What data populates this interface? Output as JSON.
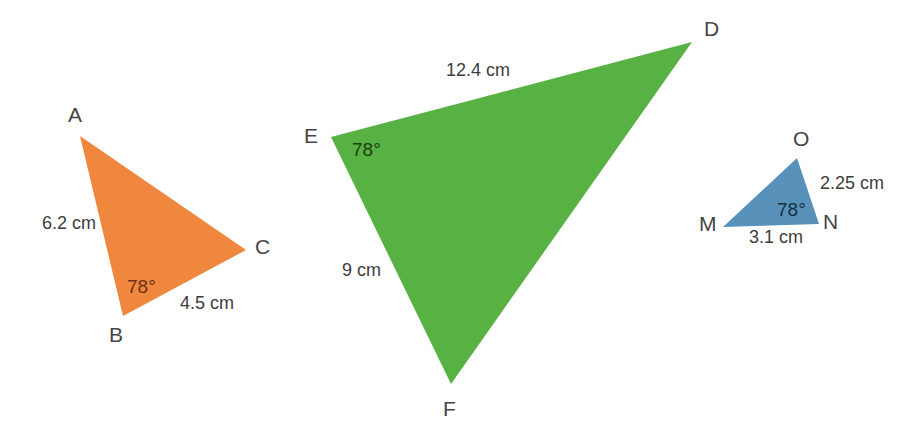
{
  "figure": {
    "background_color": "#ffffff",
    "width": 923,
    "height": 445
  },
  "triangles": [
    {
      "id": "triangle-abc",
      "name": "orange-triangle",
      "fill_color": "#F0873F",
      "vertices": [
        {
          "label": "A",
          "x": 80,
          "y": 136
        },
        {
          "label": "B",
          "x": 123,
          "y": 316
        },
        {
          "label": "C",
          "x": 246,
          "y": 250
        }
      ],
      "vertex_labels": [
        {
          "text": "A",
          "x": 68,
          "y": 104
        },
        {
          "text": "B",
          "x": 109,
          "y": 324
        },
        {
          "text": "C",
          "x": 255,
          "y": 236
        }
      ],
      "side_labels": [
        {
          "text": "6.2 cm",
          "x": 42,
          "y": 214
        },
        {
          "text": "4.5 cm",
          "x": 180,
          "y": 294
        }
      ],
      "angle_labels": [
        {
          "text": "78°",
          "x": 127,
          "y": 277
        }
      ]
    },
    {
      "id": "triangle-def",
      "name": "green-triangle",
      "fill_color": "#57B143",
      "vertices": [
        {
          "label": "D",
          "x": 692,
          "y": 42
        },
        {
          "label": "E",
          "x": 331,
          "y": 137
        },
        {
          "label": "F",
          "x": 451,
          "y": 384
        }
      ],
      "vertex_labels": [
        {
          "text": "D",
          "x": 704,
          "y": 18
        },
        {
          "text": "E",
          "x": 304,
          "y": 125
        },
        {
          "text": "F",
          "x": 443,
          "y": 398
        }
      ],
      "side_labels": [
        {
          "text": "12.4 cm",
          "x": 446,
          "y": 61
        },
        {
          "text": "9 cm",
          "x": 342,
          "y": 261
        }
      ],
      "angle_labels": [
        {
          "text": "78°",
          "x": 352,
          "y": 140
        }
      ]
    },
    {
      "id": "triangle-mno",
      "name": "blue-triangle",
      "fill_color": "#5892BA",
      "vertices": [
        {
          "label": "M",
          "x": 723,
          "y": 227
        },
        {
          "label": "N",
          "x": 819,
          "y": 224
        },
        {
          "label": "O",
          "x": 797,
          "y": 158
        }
      ],
      "vertex_labels": [
        {
          "text": "M",
          "x": 699,
          "y": 213
        },
        {
          "text": "N",
          "x": 823,
          "y": 211
        },
        {
          "text": "O",
          "x": 793,
          "y": 128
        }
      ],
      "side_labels": [
        {
          "text": "2.25 cm",
          "x": 820,
          "y": 174
        },
        {
          "text": "3.1 cm",
          "x": 749,
          "y": 228
        }
      ],
      "angle_labels": [
        {
          "text": "78°",
          "x": 777,
          "y": 200
        }
      ]
    }
  ],
  "labels": {
    "A": "A",
    "B": "B",
    "C": "C",
    "D": "D",
    "E": "E",
    "F": "F",
    "M": "M",
    "N": "N",
    "O": "O",
    "ab_side": "6.2 cm",
    "bc_side": "4.5 cm",
    "abc_angle": "78°",
    "ed_side": "12.4 cm",
    "ef_side": "9 cm",
    "def_angle": "78°",
    "on_side": "2.25 cm",
    "mn_side": "3.1 cm",
    "mno_angle": "78°"
  }
}
